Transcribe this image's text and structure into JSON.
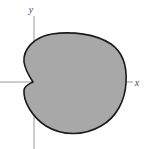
{
  "figure": {
    "name": "cardioid-shaded-region",
    "background_color": "#ffffff",
    "fill_color": "#a8a8a8",
    "outline_color": "#1a1a1a",
    "outline_width": 1.6,
    "axis_color": "#999999",
    "axis_width": 1
  },
  "axes": {
    "x": {
      "label": "x",
      "label_x": 137,
      "label_y": 86,
      "line_y": 82,
      "line_x_start": 0,
      "line_x_end": 133
    },
    "y": {
      "label": "y",
      "label_x": 31,
      "label_y": 13,
      "line_x": 34,
      "line_y_start": 16,
      "line_y_end": 149
    },
    "origin": {
      "x": 34,
      "y": 82
    }
  },
  "chart_data": {
    "type": "line",
    "title": "",
    "xlabel": "x",
    "ylabel": "y",
    "curve": "cardioid",
    "polar_equation": "r = a(1 + cos θ)",
    "cusp_point": {
      "x": 33,
      "y": 82
    },
    "extents": {
      "left": 23,
      "right": 125,
      "top": 33,
      "bottom": 133
    },
    "grid": false,
    "legend": null,
    "path": "M 33 82 C 29 76 25 70 24 62 C 23 50 33 37 52 34 C 72 31 96 34 111 44 C 124 53 127 68 126 83 C 125 100 117 117 101 126 C 84 136 62 136 46 126 C 32 117 23 101 24 90 C 25 85 29 84 33 82 Z"
  }
}
